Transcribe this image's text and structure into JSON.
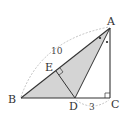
{
  "diagram": {
    "type": "geometry",
    "points": {
      "A": {
        "label": "A",
        "x": 110,
        "y": 28
      },
      "B": {
        "label": "B",
        "x": 21,
        "y": 98
      },
      "C": {
        "label": "C",
        "x": 110,
        "y": 98
      },
      "D": {
        "label": "D",
        "x": 75,
        "y": 98
      },
      "E": {
        "label": "E",
        "x": 56,
        "y": 70
      }
    },
    "measurements": {
      "AB": "10",
      "DC": "3"
    },
    "colors": {
      "shade": "#d4d4d4",
      "line": "#333333",
      "dashed": "#999999"
    }
  }
}
